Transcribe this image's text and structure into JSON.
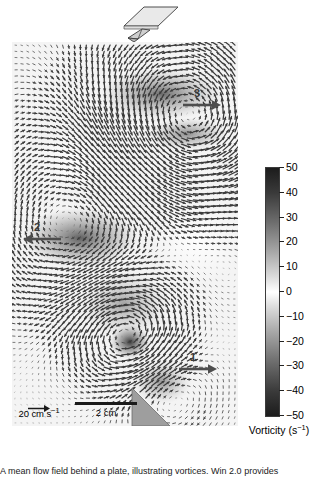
{
  "figure": {
    "type": "piv-vorticity-vector-field",
    "background_color": "#ffffff"
  },
  "inset": {
    "name": "light-sheet-schematic",
    "plane_label": "laser-light-sheet-plane",
    "body_label": "fish-body",
    "plane_fill": "#e8e8e8",
    "plane_stroke": "#4a4a4a",
    "body_fill": "#cfcfcf"
  },
  "field": {
    "name": "vector-field-panel",
    "background": "#f2f2f2",
    "grid_cols": 38,
    "grid_rows": 62,
    "vector_color": "#555555",
    "fin_shape_fill": "#9e9e9e",
    "vortex_core_color": "#2b2b2b"
  },
  "annotations": [
    {
      "id": "3",
      "label": "3",
      "arrow_direction": "right",
      "x": 182,
      "y": 88
    },
    {
      "id": "2",
      "label": "2",
      "arrow_direction": "left",
      "x": 22,
      "y": 222
    },
    {
      "id": "1",
      "label": "1",
      "arrow_direction": "right",
      "x": 178,
      "y": 352
    }
  ],
  "velocity_scale": {
    "name": "velocity-reference-vector",
    "value": "20",
    "unit_main": "cm s",
    "unit_exp": "−1",
    "label": "20 cm s−1",
    "arrow_direction": "right"
  },
  "length_scale": {
    "name": "spatial-scale-bar",
    "label": "2 cm",
    "value": "2",
    "unit": "cm"
  },
  "colorbar": {
    "name": "vorticity-colorbar",
    "title_main": "Vorticity (s",
    "title_exp": "−1",
    "title_tail": ")",
    "title": "Vorticity (s−1)",
    "vmin": -50,
    "vmax": 50,
    "ticks": [
      50,
      40,
      30,
      20,
      10,
      0,
      -10,
      -20,
      -30,
      -40,
      -50
    ],
    "tick_labels": [
      "50",
      "40",
      "30",
      "20",
      "10",
      "0",
      "−10",
      "−20",
      "−30",
      "−40",
      "−50"
    ],
    "colormap": "diverging-grayscale",
    "border_color": "#3b3b3b"
  },
  "chart_data": {
    "type": "heatmap",
    "title": "",
    "xlabel": "",
    "ylabel": "",
    "colorbar_label": "Vorticity (s−1)",
    "clim": [
      -50,
      50
    ],
    "cticks": [
      -50,
      -40,
      -30,
      -20,
      -10,
      0,
      10,
      20,
      30,
      40,
      50
    ],
    "grid": false,
    "legend": "none",
    "overlay": "velocity-vector-quiver",
    "scale_bars": {
      "velocity": "20 cm s−1",
      "length": "2 cm"
    },
    "annotations": [
      "1",
      "2",
      "3"
    ]
  },
  "caption": {
    "text": "A mean flow field behind a plate, illustrating vortices. Win 2.0 provides"
  }
}
